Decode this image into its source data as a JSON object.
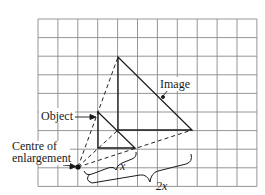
{
  "diagram": {
    "type": "enlargement",
    "grid": {
      "cols": 11,
      "rows": 9,
      "x0": 38,
      "y0": 19,
      "cell_w": 19.9,
      "cell_h": 18.6,
      "line_color": "#8a8a8a"
    },
    "labels": {
      "object": "Object",
      "image": "Image",
      "centre_line1": "Centre of",
      "centre_line2": "enlargement",
      "distance_small": "x",
      "distance_large": "2x"
    },
    "centre_point": {
      "x": 78,
      "y": 167
    },
    "object_triangle": [
      [
        98,
        112
      ],
      [
        98,
        148
      ],
      [
        135,
        148
      ]
    ],
    "image_triangle": [
      [
        118,
        57
      ],
      [
        118,
        130
      ],
      [
        192,
        130
      ]
    ],
    "scale_factor_relation": "distance from centre doubles: x to 2x"
  }
}
